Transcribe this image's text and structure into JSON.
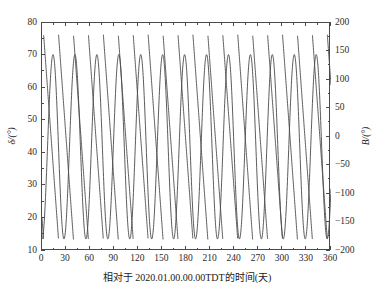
{
  "chart_data": {
    "type": "line",
    "title": "",
    "xlabel": "相对于 2020.01.00.00.00TDT的时间(天)",
    "ylabel_left": "δ/(°)",
    "ylabel_right": "B/(°)",
    "xlim": [
      0,
      360
    ],
    "ylim_left": [
      10,
      80
    ],
    "ylim_right": [
      -200,
      200
    ],
    "xticks": [
      0,
      30,
      60,
      90,
      120,
      150,
      180,
      210,
      240,
      270,
      300,
      330,
      360
    ],
    "yticks_left": [
      10,
      20,
      30,
      40,
      50,
      60,
      70,
      80
    ],
    "yticks_right": [
      -200,
      -150,
      -100,
      -50,
      0,
      50,
      100,
      150,
      200
    ],
    "grid": false,
    "legend": null,
    "line_color": "#4a4a4a",
    "series": [
      {
        "name": "δ",
        "axis": "left",
        "kind": "sinusoid",
        "period_days": 27.32,
        "mean_deg": 42.0,
        "amplitude_deg": 28.3,
        "phase_days": 6.9,
        "description": "Smooth declination oscillation between about 14 and 70 degrees with a 27.3 day lunar period."
      },
      {
        "name": "B",
        "axis": "right",
        "kind": "sawtooth",
        "period_days": 18.6,
        "min_deg": -180,
        "max_deg": 180,
        "slope_sign": "descending",
        "phase_days": 2.0,
        "description": "Sawtooth angle wrapping from +180 down to -180 degrees with an 18.6 day repeat."
      }
    ]
  },
  "axes": {
    "x_tick_labels": [
      "0",
      "30",
      "60",
      "90",
      "120",
      "150",
      "180",
      "210",
      "240",
      "270",
      "300",
      "330",
      "360"
    ],
    "y_left_tick_labels": [
      "10",
      "20",
      "30",
      "40",
      "50",
      "60",
      "70",
      "80"
    ],
    "y_right_tick_labels": [
      "−200",
      "−150",
      "−100",
      "−50",
      "0",
      "50",
      "100",
      "150",
      "200"
    ],
    "y_left_title": "δ/(°)",
    "y_right_title": "B/(°)",
    "x_title": "相对于 2020.01.00.00.00TDT的时间(天)"
  }
}
